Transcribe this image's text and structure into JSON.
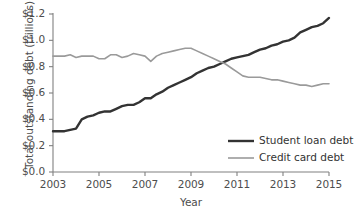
{
  "chart_data": {
    "type": "line",
    "title": "",
    "xlabel": "Year",
    "ylabel": "Total outstanding debt (trillions)",
    "xlim": [
      2003,
      2015
    ],
    "ylim": [
      0.0,
      1.2
    ],
    "grid": false,
    "legend_position": "inside-lower-right",
    "xticks": [
      "2003",
      "2005",
      "2007",
      "2009",
      "2011",
      "2013",
      "2015"
    ],
    "xtick_values": [
      2003,
      2005,
      2007,
      2009,
      2011,
      2013,
      2015
    ],
    "yticks": [
      "$0.0",
      "$0.2",
      "$0.4",
      "$0.6",
      "$0.8",
      "$1.0",
      "$1.2"
    ],
    "ytick_values": [
      0.0,
      0.2,
      0.4,
      0.6,
      0.8,
      1.0,
      1.2
    ],
    "x": [
      2003.0,
      2003.25,
      2003.5,
      2003.75,
      2004.0,
      2004.25,
      2004.5,
      2004.75,
      2005.0,
      2005.25,
      2005.5,
      2005.75,
      2006.0,
      2006.25,
      2006.5,
      2006.75,
      2007.0,
      2007.25,
      2007.5,
      2007.75,
      2008.0,
      2008.25,
      2008.5,
      2008.75,
      2009.0,
      2009.25,
      2009.5,
      2009.75,
      2010.0,
      2010.25,
      2010.5,
      2010.75,
      2011.0,
      2011.25,
      2011.5,
      2011.75,
      2012.0,
      2012.25,
      2012.5,
      2012.75,
      2013.0,
      2013.25,
      2013.5,
      2013.75,
      2014.0,
      2014.25,
      2014.5,
      2014.75,
      2015.0
    ],
    "series": [
      {
        "name": "Student loan debt",
        "color": "#333333",
        "width": 2.4,
        "values": [
          0.31,
          0.31,
          0.31,
          0.32,
          0.33,
          0.4,
          0.42,
          0.43,
          0.45,
          0.46,
          0.46,
          0.48,
          0.5,
          0.51,
          0.51,
          0.53,
          0.56,
          0.56,
          0.59,
          0.61,
          0.64,
          0.66,
          0.68,
          0.7,
          0.72,
          0.75,
          0.77,
          0.79,
          0.8,
          0.82,
          0.84,
          0.86,
          0.87,
          0.88,
          0.89,
          0.91,
          0.93,
          0.94,
          0.96,
          0.97,
          0.99,
          1.0,
          1.02,
          1.06,
          1.08,
          1.1,
          1.11,
          1.13,
          1.17
        ]
      },
      {
        "name": "Credit card debt",
        "color": "#9a9a9a",
        "width": 1.6,
        "values": [
          0.88,
          0.88,
          0.88,
          0.89,
          0.87,
          0.88,
          0.88,
          0.88,
          0.86,
          0.86,
          0.89,
          0.89,
          0.87,
          0.88,
          0.9,
          0.89,
          0.88,
          0.84,
          0.88,
          0.9,
          0.91,
          0.92,
          0.93,
          0.94,
          0.94,
          0.92,
          0.9,
          0.88,
          0.86,
          0.84,
          0.82,
          0.79,
          0.76,
          0.73,
          0.72,
          0.72,
          0.72,
          0.71,
          0.7,
          0.7,
          0.69,
          0.68,
          0.67,
          0.66,
          0.66,
          0.65,
          0.66,
          0.67,
          0.67
        ]
      }
    ]
  },
  "axes": {
    "geometry": {
      "left": 53,
      "right": 329,
      "top": 14,
      "bottom": 172
    }
  },
  "legend": {
    "items": [
      {
        "label": "Student loan debt",
        "color": "#333333",
        "width": 2.4
      },
      {
        "label": "Credit card debt",
        "color": "#9a9a9a",
        "width": 1.6
      }
    ],
    "x": 228,
    "y_start": 141,
    "y_step": 17,
    "swatch_width": 26
  }
}
